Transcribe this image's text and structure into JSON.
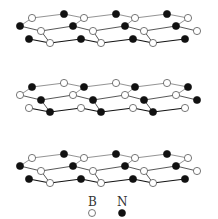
{
  "figure": {
    "layers": 3,
    "colors": {
      "boron": "#ffffff",
      "nitrogen": "#111111",
      "bond": "#333333"
    }
  },
  "legend": {
    "items": [
      {
        "label": "B",
        "symbol": "open-circle"
      },
      {
        "label": "N",
        "symbol": "filled-circle"
      }
    ]
  }
}
